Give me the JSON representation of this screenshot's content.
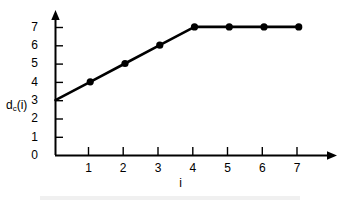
{
  "chart_data": {
    "type": "line",
    "title": "",
    "subtitle": "",
    "xlabel": "i",
    "ylabel": "d_c(i)",
    "ylabel_base": "d",
    "ylabel_sub": "c",
    "ylabel_arg": "(i)",
    "x": [
      0,
      1,
      2,
      3,
      4,
      5,
      6,
      7
    ],
    "values": [
      3,
      4,
      5,
      6,
      7,
      7,
      7,
      7
    ],
    "series": [
      {
        "name": "d_c(i)",
        "x": [
          0,
          1,
          2,
          3,
          4,
          5,
          6,
          7
        ],
        "values": [
          3,
          4,
          5,
          6,
          7,
          7,
          7,
          7
        ],
        "color": "#000000",
        "marker": "filled-circle",
        "marker_at_origin": false
      }
    ],
    "xlim": [
      0,
      7.8
    ],
    "ylim": [
      0,
      7.4
    ],
    "xticks": [
      1,
      2,
      3,
      4,
      5,
      6,
      7
    ],
    "xtick_labels": [
      "1",
      "2",
      "3",
      "4",
      "5",
      "6",
      "7"
    ],
    "yticks": [
      0,
      1,
      2,
      3,
      4,
      5,
      6,
      7
    ],
    "ytick_labels": [
      "0",
      "1",
      "2",
      "3",
      "4",
      "5",
      "6",
      "7"
    ],
    "grid": false,
    "legend": "none",
    "axis_arrows": {
      "x": "right",
      "y": "up"
    },
    "annotations": [],
    "colors": {
      "line": "#000000",
      "marker": "#000000",
      "axis": "#000000",
      "background": "#ffffff"
    }
  },
  "axes": {
    "y_ticks": [
      {
        "label": "7",
        "value": 7
      },
      {
        "label": "6",
        "value": 6
      },
      {
        "label": "5",
        "value": 5
      },
      {
        "label": "4",
        "value": 4
      },
      {
        "label": "3",
        "value": 3
      },
      {
        "label": "2",
        "value": 2
      },
      {
        "label": "1",
        "value": 1
      },
      {
        "label": "0",
        "value": 0
      }
    ],
    "x_ticks": [
      {
        "label": "1",
        "value": 1
      },
      {
        "label": "2",
        "value": 2
      },
      {
        "label": "3",
        "value": 3
      },
      {
        "label": "4",
        "value": 4
      },
      {
        "label": "5",
        "value": 5
      },
      {
        "label": "6",
        "value": 6
      },
      {
        "label": "7",
        "value": 7
      }
    ]
  }
}
